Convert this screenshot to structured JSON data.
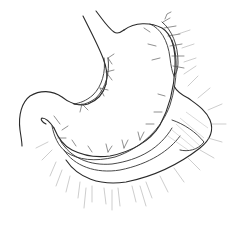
{
  "figure": {
    "subject": "stomach with gastric blood vessels and omentum",
    "style": "black and white line drawing",
    "colors": {
      "background": "#ffffff",
      "outline": "#2a2a2a",
      "vessel": "#333333",
      "fringe": "#9a9a9a"
    }
  }
}
